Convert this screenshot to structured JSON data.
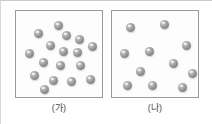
{
  "figure": {
    "type": "particle-density-comparison-diagram",
    "background_color": "#ffffff",
    "border_color": "#c9c9c9"
  },
  "panels": [
    {
      "id": "panel-ga",
      "caption": "(가)",
      "box": {
        "border_color": "#9b9b9b",
        "fill_color": "#fdfdfd",
        "width": 88,
        "height": 88
      },
      "particle": {
        "count": 17,
        "color": "#8f8f8f",
        "highlight_color": "#d9d9d9",
        "diameter": 9,
        "shape": "sphere"
      },
      "positions": [
        {
          "x": 38,
          "y": 10
        },
        {
          "x": 18,
          "y": 18
        },
        {
          "x": 46,
          "y": 20
        },
        {
          "x": 30,
          "y": 30
        },
        {
          "x": 59,
          "y": 24
        },
        {
          "x": 9,
          "y": 38
        },
        {
          "x": 43,
          "y": 36
        },
        {
          "x": 57,
          "y": 37
        },
        {
          "x": 72,
          "y": 31
        },
        {
          "x": 23,
          "y": 47
        },
        {
          "x": 40,
          "y": 50
        },
        {
          "x": 60,
          "y": 50
        },
        {
          "x": 14,
          "y": 60
        },
        {
          "x": 33,
          "y": 65
        },
        {
          "x": 51,
          "y": 66
        },
        {
          "x": 70,
          "y": 64
        },
        {
          "x": 24,
          "y": 74
        }
      ]
    },
    {
      "id": "panel-na",
      "caption": "(나)",
      "box": {
        "border_color": "#9b9b9b",
        "fill_color": "#fdfdfd",
        "width": 88,
        "height": 88
      },
      "particle": {
        "count": 11,
        "color": "#8f8f8f",
        "highlight_color": "#d9d9d9",
        "diameter": 9,
        "shape": "sphere"
      },
      "positions": [
        {
          "x": 14,
          "y": 12
        },
        {
          "x": 48,
          "y": 9
        },
        {
          "x": 70,
          "y": 30
        },
        {
          "x": 8,
          "y": 38
        },
        {
          "x": 33,
          "y": 36
        },
        {
          "x": 57,
          "y": 48
        },
        {
          "x": 76,
          "y": 58
        },
        {
          "x": 11,
          "y": 70
        },
        {
          "x": 36,
          "y": 70
        },
        {
          "x": 66,
          "y": 72
        },
        {
          "x": 24,
          "y": 56
        }
      ]
    }
  ]
}
